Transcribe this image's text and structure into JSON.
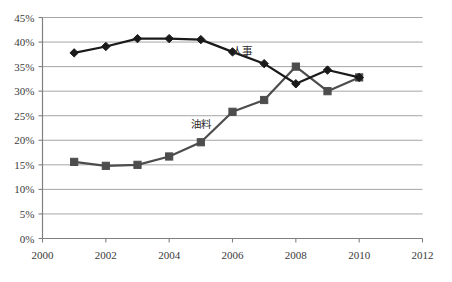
{
  "chart_data": {
    "type": "line",
    "title": "",
    "xlabel": "",
    "ylabel": "",
    "xlim": [
      2000,
      2012
    ],
    "ylim": [
      0,
      0.45
    ],
    "ytick_labels": [
      "45%",
      "40%",
      "35%",
      "30%",
      "25%",
      "20%",
      "15%",
      "10%",
      "5%",
      "0%"
    ],
    "ytick_values": [
      45,
      40,
      35,
      30,
      25,
      20,
      15,
      10,
      5,
      0
    ],
    "xtick_labels": [
      "2000",
      "2002",
      "2004",
      "2006",
      "2008",
      "2010",
      "2012"
    ],
    "xtick_values": [
      2000,
      2002,
      2004,
      2006,
      2008,
      2010,
      2012
    ],
    "x": [
      2001,
      2002,
      2003,
      2004,
      2005,
      2006,
      2007,
      2008,
      2009,
      2010
    ],
    "grid": "horizontal",
    "legend": "inline-annotations",
    "series": [
      {
        "name": "人事",
        "marker": "diamond",
        "color": "#1a1a1a",
        "label_x": 2006.3,
        "label_y": 37.3,
        "values": [
          37.8,
          39.1,
          40.7,
          40.7,
          40.5,
          38.0,
          35.6,
          31.5,
          34.3,
          32.8
        ]
      },
      {
        "name": "油料",
        "marker": "square",
        "color": "#4d4d4d",
        "label_x": 2005.0,
        "label_y": 22.6,
        "values": [
          15.6,
          14.8,
          15.0,
          16.7,
          19.6,
          25.8,
          28.2,
          35.0,
          30.0,
          32.8
        ]
      }
    ]
  },
  "axes": {
    "y_ticks": [
      {
        "label": "45%",
        "value": 45
      },
      {
        "label": "40%",
        "value": 40
      },
      {
        "label": "35%",
        "value": 35
      },
      {
        "label": "30%",
        "value": 30
      },
      {
        "label": "25%",
        "value": 25
      },
      {
        "label": "20%",
        "value": 20
      },
      {
        "label": "15%",
        "value": 15
      },
      {
        "label": "10%",
        "value": 10
      },
      {
        "label": "5%",
        "value": 5
      },
      {
        "label": "0%",
        "value": 0
      }
    ],
    "x_ticks": [
      {
        "label": "2000",
        "value": 2000
      },
      {
        "label": "2002",
        "value": 2002
      },
      {
        "label": "2004",
        "value": 2004
      },
      {
        "label": "2006",
        "value": 2006
      },
      {
        "label": "2008",
        "value": 2008
      },
      {
        "label": "2010",
        "value": 2010
      },
      {
        "label": "2012",
        "value": 2012
      }
    ]
  },
  "annotations": {
    "renshi_label": "人事",
    "youliao_label": "油料"
  },
  "colors": {
    "axis": "#808080",
    "grid": "#a6a6a6",
    "series_renshi": "#1a1a1a",
    "series_youliao": "#4d4d4d",
    "text": "#3a3a3a",
    "background": "#ffffff"
  }
}
